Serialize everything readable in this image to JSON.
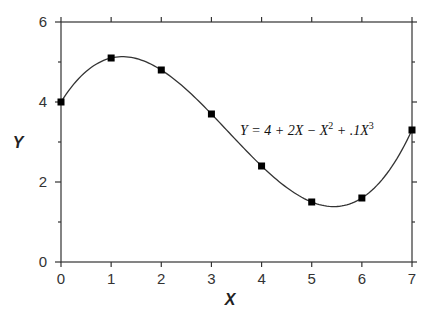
{
  "chart_data": {
    "type": "line",
    "title": "",
    "xlabel": "X",
    "ylabel": "Y",
    "xlim": [
      0,
      7
    ],
    "ylim": [
      0,
      6
    ],
    "x_ticks": [
      0,
      1,
      2,
      3,
      4,
      5,
      6,
      7
    ],
    "x_tick_labels": [
      "0",
      "1",
      "2",
      "3",
      "4",
      "5",
      "6",
      "7"
    ],
    "y_ticks_major": [
      0,
      2,
      4,
      6
    ],
    "y_tick_labels": [
      "0",
      "2",
      "4",
      "6"
    ],
    "y_ticks_minor": [
      1,
      3,
      5
    ],
    "grid": false,
    "legend": null,
    "annotation": {
      "text_parts": [
        "Y = 4 + 2X − X",
        "2",
        " + .1X",
        "3"
      ],
      "equation": "Y = 4 + 2X - X^2 + .1X^3",
      "x": 3.55,
      "y": 3.4
    },
    "series": [
      {
        "name": "Y = 4 + 2X - X^2 + .1X^3",
        "style": "smooth curve with square markers",
        "x": [
          0,
          1,
          2,
          3,
          4,
          5,
          6,
          7
        ],
        "values": [
          4.0,
          5.1,
          4.8,
          3.7,
          2.4,
          1.5,
          1.6,
          3.3
        ],
        "coefficients": {
          "c0": 4,
          "c1": 2,
          "c2": -1,
          "c3": 0.1
        }
      }
    ]
  },
  "labels": {
    "x_axis_title": "X",
    "y_axis_title": "Y",
    "equation_main": "Y = 4 + 2X − X",
    "equation_exp1": "2",
    "equation_mid": " + .1X",
    "equation_exp2": "3"
  }
}
